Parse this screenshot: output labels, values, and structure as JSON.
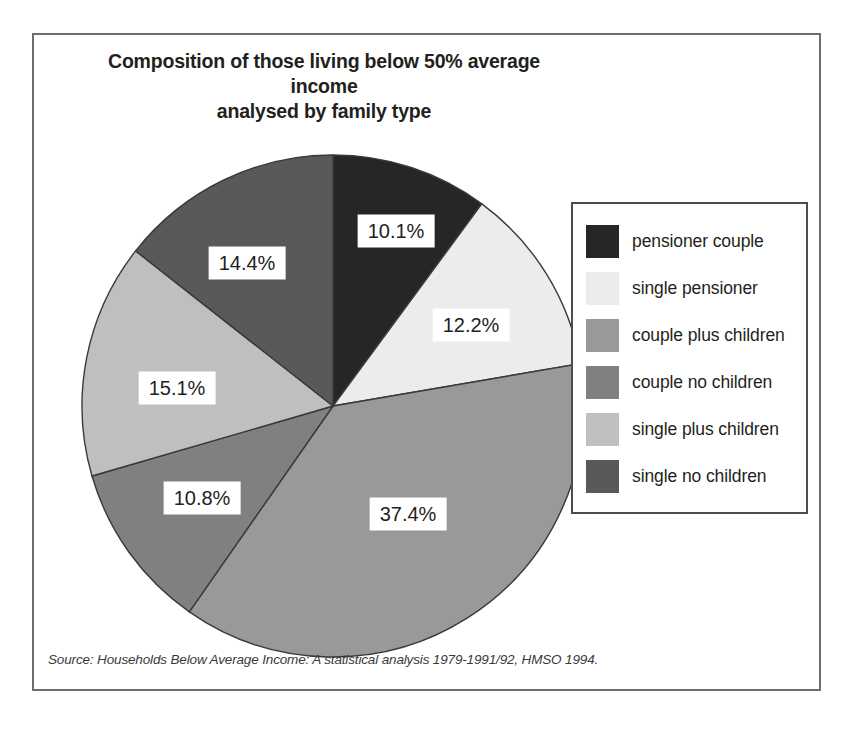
{
  "chart_data": {
    "type": "pie",
    "title": "Composition of those living below 50% average income analysed by family type",
    "title_line1": "Composition of those living below 50% average income",
    "title_line2": "analysed by family type",
    "xlabel": "",
    "ylabel": "",
    "units": "percent",
    "start_angle_deg": 0,
    "direction": "clockwise",
    "grid": false,
    "legend_position": "right",
    "source": "Source: Households Below Average Income: A statistical analysis 1979-1991/92, HMSO 1994.",
    "categories": [
      "pensioner couple",
      "single pensioner",
      "couple plus children",
      "couple no children",
      "single plus children",
      "single no children"
    ],
    "values": [
      10.1,
      12.2,
      37.4,
      10.8,
      15.1,
      14.4
    ],
    "labels": [
      "10.1%",
      "12.2%",
      "37.4%",
      "10.8%",
      "15.1%",
      "14.4%"
    ],
    "colors": [
      "#262626",
      "#ececec",
      "#999999",
      "#808080",
      "#bfbfbf",
      "#595959"
    ],
    "slices": [
      {
        "category": "pensioner couple",
        "value": 10.1,
        "label": "10.1%",
        "color": "#262626",
        "label_x": 362,
        "label_y": 196
      },
      {
        "category": "single pensioner",
        "value": 12.2,
        "label": "12.2%",
        "color": "#ececec",
        "label_x": 437,
        "label_y": 290
      },
      {
        "category": "couple plus children",
        "value": 37.4,
        "label": "37.4%",
        "color": "#999999",
        "label_x": 374,
        "label_y": 479
      },
      {
        "category": "couple no children",
        "value": 10.8,
        "label": "10.8%",
        "color": "#808080",
        "label_x": 168,
        "label_y": 463
      },
      {
        "category": "single plus children",
        "value": 15.1,
        "label": "15.1%",
        "color": "#bfbfbf",
        "label_x": 143,
        "label_y": 353
      },
      {
        "category": "single no children",
        "value": 14.4,
        "label": "14.4%",
        "color": "#595959",
        "label_x": 213,
        "label_y": 228
      }
    ]
  },
  "legend": {
    "items": [
      {
        "label": "pensioner couple",
        "color": "#262626"
      },
      {
        "label": "single pensioner",
        "color": "#ececec"
      },
      {
        "label": "couple plus children",
        "color": "#999999"
      },
      {
        "label": "couple no children",
        "color": "#808080"
      },
      {
        "label": "single plus children",
        "color": "#bfbfbf"
      },
      {
        "label": "single no children",
        "color": "#595959"
      }
    ]
  }
}
